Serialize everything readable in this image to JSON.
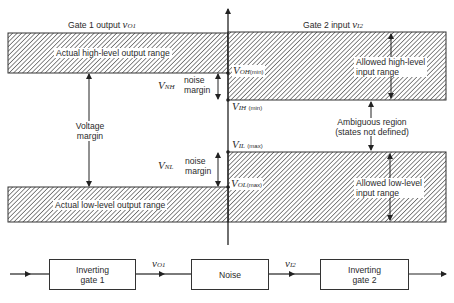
{
  "title_left": {
    "text": "Gate 1 output",
    "var": "v",
    "sub": "O1"
  },
  "title_right": {
    "text": "Gate 2 input",
    "var": "v",
    "sub": "I2"
  },
  "regions": {
    "actual_high": "Actual high-level output range",
    "actual_low": "Actual low-level output range",
    "allowed_high": [
      "Allowed high-level",
      "input range"
    ],
    "allowed_low": [
      "Allowed low-level",
      "input range"
    ],
    "ambiguous": [
      "Ambiguous region",
      "(states not defined)"
    ]
  },
  "margins": {
    "voltage": [
      "Voltage",
      "margin"
    ],
    "nh": {
      "symbol": "V",
      "sub": "NH",
      "label": [
        "noise",
        "margin"
      ]
    },
    "nl": {
      "symbol": "V",
      "sub": "NL",
      "label": [
        "noise",
        "margin"
      ]
    }
  },
  "levels": {
    "voh": {
      "symbol": "V",
      "sub": "OH",
      "qual": "(min)"
    },
    "vih": {
      "symbol": "V",
      "sub": "IH",
      "qual": "(min)"
    },
    "vil": {
      "symbol": "V",
      "sub": "IL",
      "qual": "(max)"
    },
    "vol": {
      "symbol": "V",
      "sub": "OL",
      "qual": "(max)"
    }
  },
  "block_diagram": {
    "blocks": [
      {
        "label": [
          "Inverting",
          "gate 1"
        ]
      },
      {
        "label": [
          "Noise"
        ]
      },
      {
        "label": [
          "Inverting",
          "gate 2"
        ]
      }
    ],
    "signals": [
      {
        "var": "v",
        "sub": "O1"
      },
      {
        "var": "v",
        "sub": "I2"
      }
    ]
  }
}
